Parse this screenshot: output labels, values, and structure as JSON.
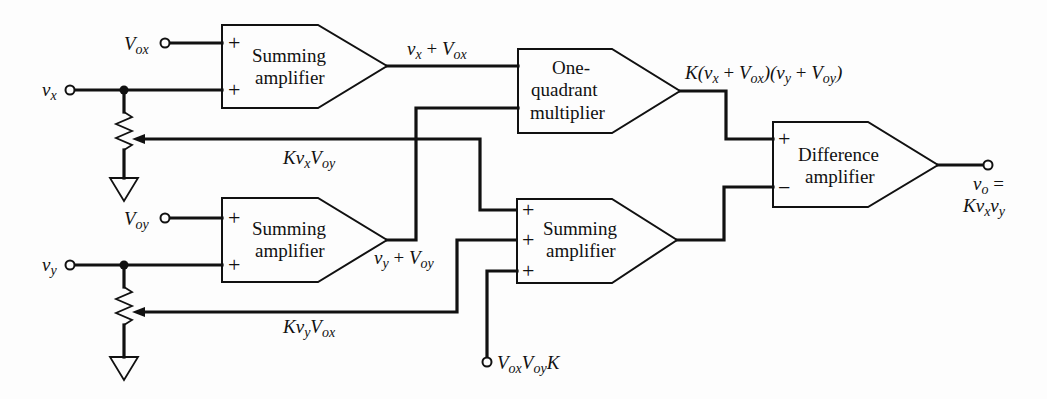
{
  "diagram": {
    "blocks": {
      "sum_x": {
        "line1": "Summing",
        "line2": "amplifier",
        "in1_sign": "+",
        "in2_sign": "+"
      },
      "sum_y": {
        "line1": "Summing",
        "line2": "amplifier",
        "in1_sign": "+",
        "in2_sign": "+"
      },
      "multiplier": {
        "line1": "One-",
        "line2": "quadrant",
        "line3": "multiplier"
      },
      "sum3": {
        "line1": "Summing",
        "line2": "amplifier",
        "in1_sign": "+",
        "in2_sign": "+",
        "in3_sign": "+"
      },
      "difference": {
        "line1": "Difference",
        "line2": "amplifier",
        "plus_sign": "+",
        "minus_sign": "−"
      }
    },
    "signals": {
      "vox_in": {
        "main": "V",
        "sub": "ox"
      },
      "vx_in": {
        "main": "v",
        "sub": "x"
      },
      "voy_in": {
        "main": "V",
        "sub": "oy"
      },
      "vy_in": {
        "main": "v",
        "sub": "y"
      },
      "vx_plus_vox": {
        "a": "v",
        "a_sub": "x",
        "op": " + ",
        "b": "V",
        "b_sub": "ox"
      },
      "vy_plus_voy": {
        "a": "v",
        "a_sub": "y",
        "op": " + ",
        "b": "V",
        "b_sub": "oy"
      },
      "k_vx_voy": {
        "k": "K",
        "a": "v",
        "a_sub": "x",
        "b": "V",
        "b_sub": "oy"
      },
      "k_vy_vox": {
        "k": "K",
        "a": "v",
        "a_sub": "y",
        "b": "V",
        "b_sub": "ox"
      },
      "product": {
        "k": "K(",
        "a": "v",
        "a_sub": "x",
        "op1": " + ",
        "b": "V",
        "b_sub": "ox",
        "mid": ")(",
        "c": "v",
        "c_sub": "y",
        "op2": " + ",
        "d": "V",
        "d_sub": "oy",
        "end": ")"
      },
      "offset_const": {
        "a": "V",
        "a_sub": "ox",
        "b": "V",
        "b_sub": "oy",
        "k": "K"
      },
      "output": {
        "line1_main": "v",
        "line1_sub": "o",
        "line1_eq": " =",
        "k": "K",
        "a": "v",
        "a_sub": "x",
        "b": "v",
        "b_sub": "y"
      }
    },
    "colors": {
      "ink": "#111111",
      "paper": "#fdfdfd"
    }
  }
}
